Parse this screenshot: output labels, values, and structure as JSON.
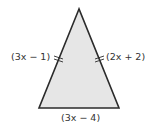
{
  "figure": {
    "shape": "isosceles-triangle",
    "fill": "#e6e6e6",
    "stroke": "#2b2b2b",
    "vertices": {
      "apex": [
        79,
        9
      ],
      "base_left": [
        39,
        108
      ],
      "base_right": [
        119,
        108
      ]
    },
    "tick_marks": "double tick on each congruent leg"
  },
  "labels": {
    "left_side": "(3x − 1)",
    "right_side": "(2x + 2)",
    "base": "(3x − 4)"
  }
}
